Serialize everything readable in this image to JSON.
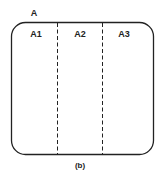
{
  "diagram": {
    "outer_label": "A",
    "regions": [
      {
        "label": "A1"
      },
      {
        "label": "A2"
      },
      {
        "label": "A3"
      }
    ],
    "caption": "(b)",
    "stroke_color": "#222222"
  }
}
